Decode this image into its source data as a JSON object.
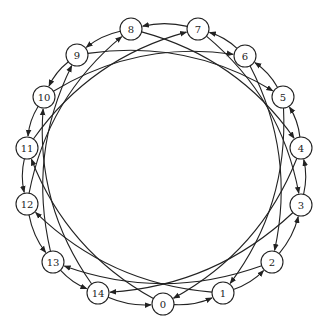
{
  "diagram": {
    "type": "directed-circulant-graph",
    "node_radius": 11,
    "colors": {
      "stroke": "#222222",
      "fill": "#ffffff",
      "background": "#ffffff"
    },
    "nodes": [
      {
        "id": 0,
        "label": "0",
        "x": 163,
        "y": 304
      },
      {
        "id": 1,
        "label": "1",
        "x": 223,
        "y": 293
      },
      {
        "id": 2,
        "label": "2",
        "x": 272,
        "y": 262
      },
      {
        "id": 3,
        "label": "3",
        "x": 301,
        "y": 205
      },
      {
        "id": 4,
        "label": "4",
        "x": 301,
        "y": 148
      },
      {
        "id": 5,
        "label": "5",
        "x": 283,
        "y": 97
      },
      {
        "id": 6,
        "label": "6",
        "x": 245,
        "y": 56
      },
      {
        "id": 7,
        "label": "7",
        "x": 198,
        "y": 29
      },
      {
        "id": 8,
        "label": "8",
        "x": 131,
        "y": 29
      },
      {
        "id": 9,
        "label": "9",
        "x": 77,
        "y": 55
      },
      {
        "id": 10,
        "label": "10",
        "x": 44,
        "y": 97
      },
      {
        "id": 11,
        "label": "11",
        "x": 27,
        "y": 148
      },
      {
        "id": 12,
        "label": "12",
        "x": 27,
        "y": 204
      },
      {
        "id": 13,
        "label": "13",
        "x": 53,
        "y": 262
      },
      {
        "id": 14,
        "label": "14",
        "x": 98,
        "y": 293
      }
    ],
    "edges": [
      {
        "from": 0,
        "to": 1,
        "kind": "ring"
      },
      {
        "from": 1,
        "to": 2,
        "kind": "ring"
      },
      {
        "from": 2,
        "to": 3,
        "kind": "ring"
      },
      {
        "from": 3,
        "to": 4,
        "kind": "ring"
      },
      {
        "from": 4,
        "to": 5,
        "kind": "ring"
      },
      {
        "from": 5,
        "to": 6,
        "kind": "ring"
      },
      {
        "from": 6,
        "to": 7,
        "kind": "ring"
      },
      {
        "from": 7,
        "to": 8,
        "kind": "ring"
      },
      {
        "from": 8,
        "to": 9,
        "kind": "ring"
      },
      {
        "from": 9,
        "to": 10,
        "kind": "ring"
      },
      {
        "from": 10,
        "to": 11,
        "kind": "ring"
      },
      {
        "from": 11,
        "to": 12,
        "kind": "ring"
      },
      {
        "from": 12,
        "to": 13,
        "kind": "ring"
      },
      {
        "from": 13,
        "to": 14,
        "kind": "ring"
      },
      {
        "from": 14,
        "to": 0,
        "kind": "ring"
      },
      {
        "from": 4,
        "to": 0,
        "kind": "chord"
      },
      {
        "from": 5,
        "to": 1,
        "kind": "chord"
      },
      {
        "from": 6,
        "to": 2,
        "kind": "chord"
      },
      {
        "from": 7,
        "to": 3,
        "kind": "chord"
      },
      {
        "from": 8,
        "to": 4,
        "kind": "chord"
      },
      {
        "from": 9,
        "to": 5,
        "kind": "chord"
      },
      {
        "from": 10,
        "to": 6,
        "kind": "chord"
      },
      {
        "from": 11,
        "to": 7,
        "kind": "chord"
      },
      {
        "from": 12,
        "to": 8,
        "kind": "chord"
      },
      {
        "from": 13,
        "to": 9,
        "kind": "chord"
      },
      {
        "from": 14,
        "to": 10,
        "kind": "chord"
      },
      {
        "from": 0,
        "to": 11,
        "kind": "chord"
      },
      {
        "from": 1,
        "to": 12,
        "kind": "chord"
      },
      {
        "from": 2,
        "to": 13,
        "kind": "chord"
      },
      {
        "from": 3,
        "to": 14,
        "kind": "chord"
      }
    ]
  }
}
